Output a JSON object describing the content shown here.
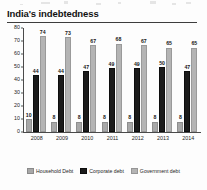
{
  "chart_data": {
    "type": "bar",
    "title": "India's indebtedness",
    "xlabel": "",
    "ylabel": "",
    "ylim": [
      0,
      80
    ],
    "yticks": [
      0,
      10,
      20,
      30,
      40,
      50,
      60,
      70,
      80
    ],
    "grid": false,
    "legend_position": "bottom",
    "categories": [
      "2008",
      "2009",
      "2010",
      "2011",
      "2012",
      "2013",
      "2014"
    ],
    "series": [
      {
        "name": "Household Debt",
        "color": "#a8a8a8",
        "values": [
          10,
          8,
          8,
          8,
          8,
          8,
          8
        ]
      },
      {
        "name": "Corporate debt",
        "color": "#1b1b1b",
        "values": [
          44,
          44,
          47,
          49,
          49,
          50,
          47
        ]
      },
      {
        "name": "Government debt",
        "color": "#b4b4b4",
        "values": [
          74,
          73,
          67,
          68,
          67,
          65,
          65
        ]
      }
    ]
  }
}
